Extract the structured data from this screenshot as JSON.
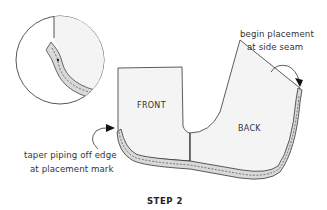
{
  "diagram": {
    "step_label": "STEP 2",
    "panels": {
      "front": "FRONT",
      "back": "BACK"
    },
    "annotations": {
      "begin_line1": "begin placement",
      "begin_line2": "at side seam",
      "taper_line1": "taper piping off edge",
      "taper_line2": "at placement mark"
    },
    "colors": {
      "fabric": "#f4f4f4",
      "piping": "#d9d9d9",
      "outline": "#333333"
    }
  }
}
